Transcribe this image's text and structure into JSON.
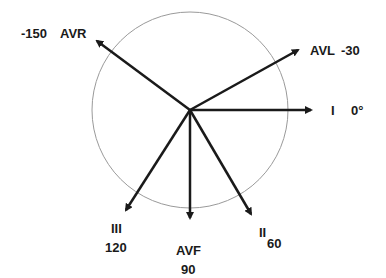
{
  "diagram": {
    "center": {
      "x": 190,
      "y": 110
    },
    "circle_radius": 98,
    "colors": {
      "arrow": "#1a1a1a",
      "circle": "#9a9a9a",
      "text": "#1a1a1a"
    },
    "leads": [
      {
        "name": "I",
        "angle_label": "0°",
        "angle": 0
      },
      {
        "name": "AVL",
        "angle_label": "-30",
        "angle": -30
      },
      {
        "name": "AVR",
        "angle_label": "-150",
        "angle": -150
      },
      {
        "name": "II",
        "angle_label": "60",
        "angle": 60
      },
      {
        "name": "AVF",
        "angle_label": "90",
        "angle": 90
      },
      {
        "name": "III",
        "angle_label": "120",
        "angle": 120
      }
    ]
  }
}
